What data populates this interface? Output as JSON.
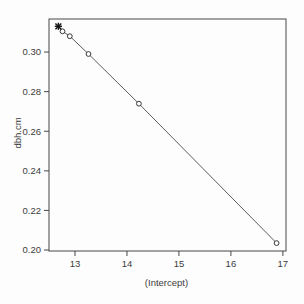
{
  "figure": {
    "kind": "r-base-graphics-scatter-plot"
  },
  "chart_data": {
    "type": "scatter",
    "title": "",
    "xlabel": "(Intercept)",
    "ylabel": "dbh.cm",
    "xlim": [
      12.5,
      17.06
    ],
    "ylim": [
      0.1995,
      0.3167
    ],
    "grid": false,
    "legend": "none",
    "x_ticks": [
      {
        "v": 13,
        "label": "13"
      },
      {
        "v": 14,
        "label": "14"
      },
      {
        "v": 15,
        "label": "15"
      },
      {
        "v": 16,
        "label": "16"
      },
      {
        "v": 17,
        "label": "17"
      }
    ],
    "y_ticks": [
      {
        "v": 0.2,
        "label": "0.20"
      },
      {
        "v": 0.22,
        "label": "0.22"
      },
      {
        "v": 0.24,
        "label": "0.24"
      },
      {
        "v": 0.26,
        "label": "0.26"
      },
      {
        "v": 0.28,
        "label": "0.28"
      },
      {
        "v": 0.3,
        "label": "0.30"
      }
    ],
    "highlight_point": {
      "x": 12.68,
      "y": 0.313,
      "marker": "asterisk-star"
    },
    "series": [
      {
        "name": "coefficient-pairs",
        "marker": "open-circle",
        "line": true,
        "points": [
          {
            "x": 12.76,
            "y": 0.3105
          },
          {
            "x": 12.9,
            "y": 0.308
          },
          {
            "x": 13.26,
            "y": 0.299
          },
          {
            "x": 14.23,
            "y": 0.2739
          },
          {
            "x": 16.88,
            "y": 0.2035
          }
        ]
      }
    ],
    "colors": {
      "background": "#fdfdfd",
      "axis": "#474747",
      "text": "#3c3c3c",
      "line": "#5c5c5c",
      "marker_stroke": "#383838",
      "marker_fill": "#fdfdfd",
      "highlight": "#161616"
    }
  }
}
